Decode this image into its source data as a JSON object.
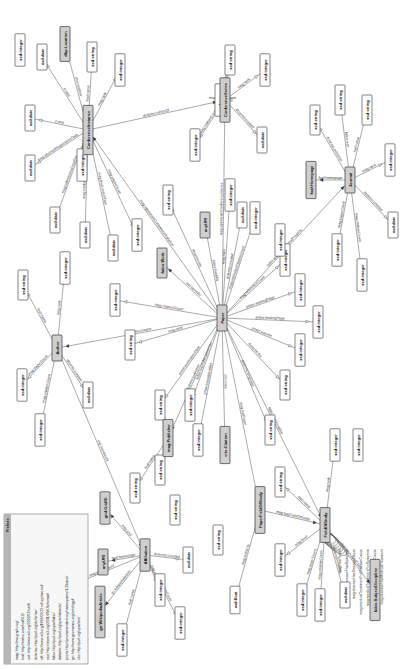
{
  "diagram": {
    "orientation": "rotated-90-ccw",
    "colors": {
      "class_fill": "#cfcfcf",
      "literal_fill": "#ffffff",
      "edge": "#555555",
      "prefix_header": "#b5b5b5"
    },
    "prefixes": {
      "title": "Prefixes",
      "lines": [
        "mag: http://ma-graph.org/",
        "foaf: http://xmlns.com/foaf/0.1/",
        "owl: http://www.w3.org/2002/07/owl#",
        "dcterms: http://purl.org/dc/terms/",
        "rdf: http://www.w3.org/1999/02/22-rdf-syntax-ns#",
        "xsd: http://www.w3.org/2001/XMLSchema#",
        "fabio: http://purl.org/spar/fabio/",
        "datacite: http://purl.org/spar/datacite/",
        "prism: http://prismstandard.org/namespaces/1.2/basic/",
        "gn: http://www.geonames.org/ontology#",
        "cito: http://purl.org/spar/cito/"
      ]
    },
    "nodes": [
      {
        "id": "paper",
        "label": "Paper",
        "kind": "class",
        "x": 222,
        "y": 318
      },
      {
        "id": "author",
        "label": "Author",
        "kind": "class",
        "x": 57,
        "y": 348
      },
      {
        "id": "affiliation",
        "label": "Affiliation",
        "kind": "class",
        "x": 145,
        "y": 555
      },
      {
        "id": "confinst",
        "label": "ConferenceInstance",
        "kind": "class",
        "x": 88,
        "y": 130
      },
      {
        "id": "confseries",
        "label": "ConferenceSeries",
        "kind": "class",
        "x": 225,
        "y": 100
      },
      {
        "id": "journal",
        "label": "Journal",
        "kind": "class",
        "x": 350,
        "y": 180
      },
      {
        "id": "fos",
        "label": "FieldOfStudy",
        "kind": "class",
        "x": 325,
        "y": 525
      },
      {
        "id": "pfos",
        "label": "PaperFieldOfStudy",
        "kind": "class",
        "x": 260,
        "y": 510
      },
      {
        "id": "publisher",
        "label": "mag:Publisher",
        "kind": "class",
        "x": 168,
        "y": 438
      },
      {
        "id": "citation",
        "label": "cito:Citation",
        "kind": "class",
        "x": 225,
        "y": 445
      },
      {
        "id": "fabiowork",
        "label": "fabio:Work",
        "kind": "class",
        "x": 162,
        "y": 263
      },
      {
        "id": "anyuri",
        "label": "anyURI",
        "kind": "class",
        "x": 205,
        "y": 225
      },
      {
        "id": "dbploc",
        "label": "dbp:Location",
        "kind": "class",
        "x": 65,
        "y": 44
      },
      {
        "id": "foafhome",
        "label": "foaf:Homepage",
        "kind": "class",
        "x": 311,
        "y": 180
      },
      {
        "id": "gridgrid",
        "label": "grid:GridID",
        "kind": "class",
        "x": 105,
        "y": 508
      },
      {
        "id": "anyuri2",
        "label": "anyURI",
        "kind": "class",
        "x": 103,
        "y": 562
      },
      {
        "id": "gnwiki",
        "label": "gn:WikipediaArticle",
        "kind": "class",
        "x": 100,
        "y": 612
      },
      {
        "id": "fabiosubj",
        "label": "fabio:SubjectDiscipline",
        "kind": "class",
        "x": 375,
        "y": 590
      }
    ],
    "literals": [
      {
        "label": "xsd:date",
        "x": 42,
        "y": 57
      },
      {
        "label": "xsd:string",
        "x": 92,
        "y": 57
      },
      {
        "label": "xsd:integer",
        "x": 120,
        "y": 70
      },
      {
        "label": "xsd:date",
        "x": 30,
        "y": 118
      },
      {
        "label": "xsd:date",
        "x": 30,
        "y": 168
      },
      {
        "label": "xsd:date",
        "x": 55,
        "y": 220
      },
      {
        "label": "xsd:date",
        "x": 85,
        "y": 235
      },
      {
        "label": "xsd:date",
        "x": 113,
        "y": 248
      },
      {
        "label": "xsd:integer",
        "x": 137,
        "y": 235
      },
      {
        "label": "xsd:integer",
        "x": 20,
        "y": 50
      },
      {
        "label": "xsd:string",
        "x": 230,
        "y": 60
      },
      {
        "label": "xsd:integer",
        "x": 220,
        "y": 100
      },
      {
        "label": "xsd:integer",
        "x": 265,
        "y": 70
      },
      {
        "label": "xsd:date",
        "x": 262,
        "y": 140
      },
      {
        "label": "xsd:integer",
        "x": 82,
        "y": 165
      },
      {
        "label": "xsd:integer",
        "x": 195,
        "y": 145
      },
      {
        "label": "xsd:string",
        "x": 23,
        "y": 285
      },
      {
        "label": "xsd:integer",
        "x": 65,
        "y": 268
      },
      {
        "label": "xsd:integer",
        "x": 22,
        "y": 385
      },
      {
        "label": "xsd:date",
        "x": 88,
        "y": 395
      },
      {
        "label": "xsd:integer",
        "x": 40,
        "y": 430
      },
      {
        "label": "xsd:string",
        "x": 130,
        "y": 345
      },
      {
        "label": "xsd:integer",
        "x": 115,
        "y": 300
      },
      {
        "label": "xsd:string",
        "x": 168,
        "y": 200
      },
      {
        "label": "xsd:integer",
        "x": 230,
        "y": 195
      },
      {
        "label": "xsd:date",
        "x": 242,
        "y": 215
      },
      {
        "label": "xsd:integer",
        "x": 255,
        "y": 218
      },
      {
        "label": "xsd:integer",
        "x": 285,
        "y": 260
      },
      {
        "label": "xsd:integer",
        "x": 300,
        "y": 290
      },
      {
        "label": "xsd:integer",
        "x": 318,
        "y": 322
      },
      {
        "label": "xsd:integer",
        "x": 300,
        "y": 350
      },
      {
        "label": "xsd:string",
        "x": 285,
        "y": 385
      },
      {
        "label": "xsd:string",
        "x": 160,
        "y": 405
      },
      {
        "label": "xsd:integer",
        "x": 190,
        "y": 405
      },
      {
        "label": "xsd:integer",
        "x": 198,
        "y": 440
      },
      {
        "label": "xsd:string",
        "x": 270,
        "y": 430
      },
      {
        "label": "xsd:string",
        "x": 135,
        "y": 488
      },
      {
        "label": "xsd:string",
        "x": 160,
        "y": 470
      },
      {
        "label": "xsd:string",
        "x": 175,
        "y": 510
      },
      {
        "label": "xsd:string",
        "x": 218,
        "y": 540
      },
      {
        "label": "xsd:float",
        "x": 235,
        "y": 600
      },
      {
        "label": "xsd:string",
        "x": 280,
        "y": 482
      },
      {
        "label": "xsd:integer",
        "x": 280,
        "y": 560
      },
      {
        "label": "xsd:integer",
        "x": 302,
        "y": 600
      },
      {
        "label": "xsd:integer",
        "x": 320,
        "y": 605
      },
      {
        "label": "xsd:date",
        "x": 345,
        "y": 595
      },
      {
        "label": "xsd:integer",
        "x": 335,
        "y": 445
      },
      {
        "label": "xsd:integer",
        "x": 358,
        "y": 445
      },
      {
        "label": "xsd:integer",
        "x": 60,
        "y": 590
      },
      {
        "label": "xsd:integer",
        "x": 160,
        "y": 590
      },
      {
        "label": "xsd:integer",
        "x": 180,
        "y": 623
      },
      {
        "label": "xsd:date",
        "x": 188,
        "y": 560
      },
      {
        "label": "xsd:integer",
        "x": 122,
        "y": 640
      },
      {
        "label": "xsd:string",
        "x": 315,
        "y": 120
      },
      {
        "label": "xsd:string",
        "x": 340,
        "y": 100
      },
      {
        "label": "xsd:string",
        "x": 367,
        "y": 110
      },
      {
        "label": "xsd:integer",
        "x": 390,
        "y": 160
      },
      {
        "label": "xsd:integer",
        "x": 337,
        "y": 250
      },
      {
        "label": "xsd:integer",
        "x": 362,
        "y": 275
      },
      {
        "label": "xsd:date",
        "x": 393,
        "y": 225
      },
      {
        "label": "xsd:integer",
        "x": 280,
        "y": 240
      }
    ],
    "edges": [
      {
        "from": "confinst",
        "to": "dbploc",
        "label": "dbo:location"
      },
      {
        "from": "confinst",
        "to": "lit:1",
        "label": "foaf:name"
      },
      {
        "from": "confinst",
        "to": "lit:2",
        "label": "mag:rank"
      },
      {
        "from": "confinst",
        "to": "lit:0",
        "label": "ti:start"
      },
      {
        "from": "confinst",
        "to": "lit:3",
        "label": "ti:end"
      },
      {
        "from": "confinst",
        "to": "lit:4",
        "label": "mag:abstractRegistrationDate"
      },
      {
        "from": "confinst",
        "to": "lit:5",
        "label": "mag:submissionDeadline"
      },
      {
        "from": "confinst",
        "to": "lit:6",
        "label": "mag:notificationDate"
      },
      {
        "from": "confinst",
        "to": "lit:7",
        "label": "mag:finalVersionDue"
      },
      {
        "from": "confinst",
        "to": "lit:8",
        "label": "mag:paperCount"
      },
      {
        "from": "confinst",
        "to": "lit:14",
        "label": "mag:citationCount"
      },
      {
        "from": "confinst",
        "to": "confseries",
        "label": "dcterms:isPartOf"
      },
      {
        "from": "confseries",
        "to": "lit:10",
        "label": "foaf:name"
      },
      {
        "from": "confseries",
        "to": "lit:11",
        "label": "mag:paperCount"
      },
      {
        "from": "confseries",
        "to": "lit:12",
        "label": "mag:rank"
      },
      {
        "from": "confseries",
        "to": "lit:13",
        "label": "dcterms:created"
      },
      {
        "from": "confseries",
        "to": "lit:15",
        "label": "mag:citationCount"
      },
      {
        "from": "author",
        "to": "lit:16",
        "label": "foaf:name"
      },
      {
        "from": "author",
        "to": "lit:17",
        "label": "mag:rank"
      },
      {
        "from": "author",
        "to": "lit:18",
        "label": "mag:paperCount"
      },
      {
        "from": "author",
        "to": "lit:19",
        "label": "dcterms:created"
      },
      {
        "from": "author",
        "to": "lit:20",
        "label": "mag:citationCount"
      },
      {
        "from": "author",
        "to": "affiliation",
        "label": "org:memberOf"
      },
      {
        "from": "paper",
        "to": "author",
        "label": "dcterms:creator"
      },
      {
        "from": "paper",
        "to": "confinst",
        "label": "mag:appearsInConferenceInstance"
      },
      {
        "from": "paper",
        "to": "confseries",
        "label": "mag:appearsInConferenceSeries"
      },
      {
        "from": "paper",
        "to": "journal",
        "label": "fabio:appearsInJournalProperty"
      },
      {
        "from": "paper",
        "to": "fabiowork",
        "label": "owl:sameAs"
      },
      {
        "from": "paper",
        "to": "anyuri",
        "label": "fabio:hasURL"
      },
      {
        "from": "paper",
        "to": "publisher",
        "label": "dcterms:publisher"
      },
      {
        "from": "paper",
        "to": "citation",
        "label": "cito:cites"
      },
      {
        "from": "paper",
        "to": "fos",
        "label": "fabio:hasDiscipline"
      },
      {
        "from": "paper",
        "to": "lit:21",
        "label": "mag:rank"
      },
      {
        "from": "paper",
        "to": "lit:22",
        "label": "mag:citationCount"
      },
      {
        "from": "paper",
        "to": "lit:23",
        "label": "dcterms:title"
      },
      {
        "from": "paper",
        "to": "lit:24",
        "label": "mag:rank"
      },
      {
        "from": "paper",
        "to": "lit:25",
        "label": "dcterms:created"
      },
      {
        "from": "paper",
        "to": "lit:26",
        "label": "mag:estimatedCitationCount"
      },
      {
        "from": "paper",
        "to": "lit:27",
        "label": "mag:referenceCount"
      },
      {
        "from": "paper",
        "to": "lit:28",
        "label": "prism:startingPage"
      },
      {
        "from": "paper",
        "to": "lit:29",
        "label": "prism:endingPage"
      },
      {
        "from": "paper",
        "to": "lit:30",
        "label": "prism:volume"
      },
      {
        "from": "paper",
        "to": "lit:31",
        "label": "datacite:doi"
      },
      {
        "from": "paper",
        "to": "lit:32",
        "label": "prism:publicationDate"
      },
      {
        "from": "paper",
        "to": "lit:33",
        "label": "fabio:hasPublicationYear"
      },
      {
        "from": "paper",
        "to": "lit:34",
        "label": "prism:issueIdentifier"
      },
      {
        "from": "paper",
        "to": "lit:35",
        "label": "dcterms:language"
      },
      {
        "from": "pfos",
        "to": "paper",
        "label": "mag:hasPaper"
      },
      {
        "from": "pfos",
        "to": "fos",
        "label": "mag:hasFieldOfStudy"
      },
      {
        "from": "pfos",
        "to": "lit:40",
        "label": "mag:similarity"
      },
      {
        "from": "fos",
        "to": "lit:41",
        "label": "foaf:name"
      },
      {
        "from": "fos",
        "to": "lit:42",
        "label": "mag:level"
      },
      {
        "from": "fos",
        "to": "lit:43",
        "label": "mag:paperCount"
      },
      {
        "from": "fos",
        "to": "lit:44",
        "label": "mag:citationCount"
      },
      {
        "from": "fos",
        "to": "lit:45",
        "label": "dcterms:created"
      },
      {
        "from": "fos",
        "to": "lit:46",
        "label": "mag:rank"
      },
      {
        "from": "fos",
        "to": "fabiosubj",
        "label": "owl:equivalentClass"
      },
      {
        "from": "publisher",
        "to": "lit:36",
        "label": "foaf:name"
      },
      {
        "from": "affiliation",
        "to": "gridgrid",
        "label": "mag:grid"
      },
      {
        "from": "affiliation",
        "to": "anyuri2",
        "label": "foaf:homepage"
      },
      {
        "from": "affiliation",
        "to": "gnwiki",
        "label": "gn:wikipediaArticle"
      },
      {
        "from": "affiliation",
        "to": "lit:49",
        "label": "mag:rank"
      },
      {
        "from": "affiliation",
        "to": "lit:48",
        "label": "mag:paperCount"
      },
      {
        "from": "affiliation",
        "to": "lit:51",
        "label": "dcterms:created"
      },
      {
        "from": "affiliation",
        "to": "lit:50",
        "label": "mag:citationCount"
      },
      {
        "from": "affiliation",
        "to": "lit:52",
        "label": "foaf:name"
      },
      {
        "from": "journal",
        "to": "foafhome",
        "label": "foaf:homepage"
      },
      {
        "from": "journal",
        "to": "lit:53",
        "label": "dcterms:publisher"
      },
      {
        "from": "journal",
        "to": "lit:54",
        "label": "fabio:issn"
      },
      {
        "from": "journal",
        "to": "lit:55",
        "label": "foaf:name"
      },
      {
        "from": "journal",
        "to": "lit:56",
        "label": "mag:rank"
      },
      {
        "from": "journal",
        "to": "lit:57",
        "label": "mag:paperCount"
      },
      {
        "from": "journal",
        "to": "lit:58",
        "label": "mag:citationCount"
      },
      {
        "from": "journal",
        "to": "lit:59",
        "label": "dcterms:created"
      }
    ],
    "fos_self_edges": [
      "mag:hasParent",
      "mag:disease/HasSymptom",
      "mag:diseaseHasDiseaseCause",
      "mag:medicalTreatmentForDiseaseCause",
      "mag:medicalTreatmentForSymptom",
      "mag:symptomHasDiseaseCause",
      "mag:diseaseHasMedicalTreatment"
    ]
  }
}
